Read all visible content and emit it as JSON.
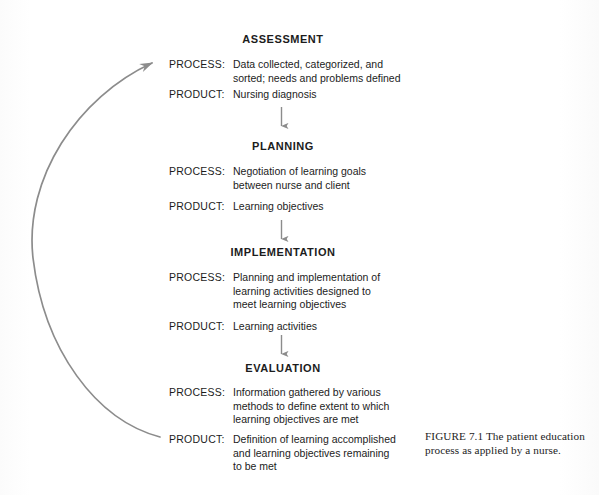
{
  "figure": {
    "caption": "FIGURE 7.1 The patient education process as applied by a nurse.",
    "arrow_color": "#8c8c8c",
    "text_color": "#1c1c1c",
    "background_color": "#fefefe",
    "feedback_arrow_name": "feedback-loop-arrow"
  },
  "labels": {
    "process": "PROCESS:",
    "product": "PRODUCT:"
  },
  "stages": [
    {
      "title": "ASSESSMENT",
      "process": "Data collected, categorized, and\nsorted; needs and problems defined",
      "product": "Nursing diagnosis"
    },
    {
      "title": "PLANNING",
      "process": "Negotiation of learning goals\nbetween nurse and client",
      "product": "Learning objectives"
    },
    {
      "title": "IMPLEMENTATION",
      "process": "Planning and implementation of\nlearning activities designed to\nmeet learning objectives",
      "product": "Learning activities"
    },
    {
      "title": "EVALUATION",
      "process": "Information gathered by various\nmethods to define extent to which\nlearning objectives are met",
      "product": "Definition of learning accomplished\nand learning objectives remaining\nto be met"
    }
  ]
}
